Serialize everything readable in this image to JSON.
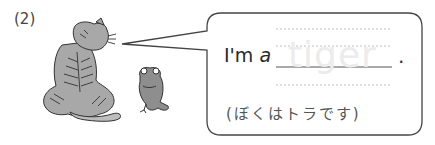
{
  "question": {
    "number": "(2)"
  },
  "bubble": {
    "prompt_prefix": "I'm",
    "prompt_article": "a",
    "answer_hint": "tiger",
    "period": ".",
    "translation": "(ぼくはトラです)"
  },
  "illustration": {
    "characters": [
      "tiger",
      "frog"
    ]
  },
  "colors": {
    "outline": "#444444",
    "animal_fill": "#a8a8a8",
    "dotted_line": "#b0b0b0",
    "watermark": "#ececec"
  }
}
